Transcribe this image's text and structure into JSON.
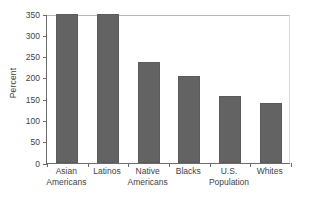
{
  "chart_data": {
    "type": "bar",
    "title": "",
    "xlabel": "",
    "ylabel": "Percent",
    "ylim": [
      0,
      350
    ],
    "ytick_values": [
      0,
      50,
      100,
      150,
      200,
      250,
      300,
      350
    ],
    "ytick_labels": [
      "0",
      "50",
      "100",
      "150",
      "200",
      "250",
      "300",
      "350"
    ],
    "grid": false,
    "legend": "none",
    "bar_color": "#636363",
    "categories": [
      {
        "line1": "Asian",
        "line2": "Americans"
      },
      {
        "line1": "Latinos",
        "line2": ""
      },
      {
        "line1": "Native",
        "line2": "Americans"
      },
      {
        "line1": "Blacks",
        "line2": ""
      },
      {
        "line1": "U.S.",
        "line2": "Population"
      },
      {
        "line1": "Whites",
        "line2": ""
      }
    ],
    "values": [
      350,
      350,
      237,
      205,
      157,
      140
    ]
  }
}
